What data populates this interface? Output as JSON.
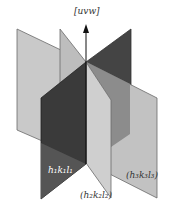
{
  "diagram": {
    "axis_label": "[uvw]",
    "planes": [
      {
        "id": "plane-1",
        "label": "h₁k₁l₁",
        "color": "#3c3c3c"
      },
      {
        "id": "plane-2",
        "label": "(h₂k₂l₂)",
        "color": "#c8c8c8"
      },
      {
        "id": "plane-3",
        "label": "(h₃k₃l₃)",
        "color": "#bdbdbd"
      }
    ],
    "colors": {
      "background": "#ffffff",
      "plane_light": "#c6c6c6",
      "plane_mid": "#8a8a8a",
      "plane_dark": "#3a3a3a",
      "edge": "#555555",
      "axis": "#111111",
      "label_on_dark": "#ffffff",
      "label_on_light": "#333333"
    }
  }
}
